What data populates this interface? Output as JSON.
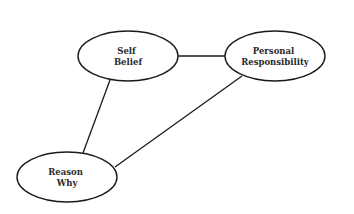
{
  "diagram": {
    "type": "concept-network",
    "background": "#ffffff",
    "stroke_color": "#1a1a1a",
    "nodes": [
      {
        "id": "self-belief",
        "lines": [
          "Self",
          "Belief"
        ],
        "cx": 128,
        "cy": 56,
        "rx": 50,
        "ry": 25
      },
      {
        "id": "personal-responsibility",
        "lines": [
          "Personal",
          "Responsibility"
        ],
        "cx": 275,
        "cy": 56,
        "rx": 50,
        "ry": 25
      },
      {
        "id": "reason-why",
        "lines": [
          "Reason",
          "Why"
        ],
        "cx": 67,
        "cy": 177,
        "rx": 50,
        "ry": 25
      }
    ],
    "edges": [
      {
        "from": "self-belief",
        "to": "personal-responsibility",
        "x1": 178,
        "y1": 56,
        "x2": 225,
        "y2": 56
      },
      {
        "from": "self-belief",
        "to": "reason-why",
        "x1": 110,
        "y1": 80,
        "x2": 83,
        "y2": 153
      },
      {
        "from": "personal-responsibility",
        "to": "reason-why",
        "x1": 242,
        "y1": 76,
        "x2": 115,
        "y2": 167
      }
    ]
  }
}
